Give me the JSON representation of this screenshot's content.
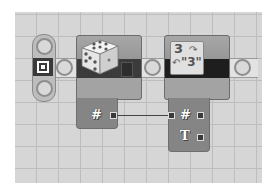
{
  "canvas": {
    "background": "#d6d6d6",
    "grid_line": "#bdbdbd",
    "grid_size_px": 22
  },
  "start_point": {
    "icon": "sequence-start-icon"
  },
  "blocks": [
    {
      "name": "Random",
      "icon": "dice-icon",
      "data_hub": {
        "plugs": [
          {
            "type": "number",
            "glyph": "#",
            "direction": "output"
          }
        ]
      }
    },
    {
      "name": "Number to Text",
      "icon": "number-to-text-icon",
      "icon_text_top": "3",
      "icon_text_bottom": "\"3\"",
      "data_hub": {
        "plugs": [
          {
            "type": "number",
            "glyph": "#",
            "direction": "input/output"
          },
          {
            "type": "text",
            "glyph": "T",
            "direction": "output"
          }
        ]
      }
    }
  ],
  "wires": [
    {
      "from": "Random.number",
      "to": "Number to Text.number"
    }
  ]
}
